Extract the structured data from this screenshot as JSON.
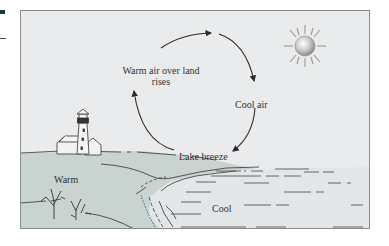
{
  "diagram": {
    "labels": {
      "warm_air_line1": "Warm air over land",
      "warm_air_line2": "rises",
      "cool_air": "Cool air",
      "lake_breeze": "Lake breeze",
      "warm": "Warm",
      "cool": "Cool"
    },
    "icons": [
      "sun-icon",
      "lighthouse-icon",
      "house-icon",
      "shrub-icon"
    ],
    "colors": {
      "sky": "#e9ebec",
      "land": "#c9d3cf",
      "water": "#e3e6e8",
      "line": "#2b2b2b",
      "frame": "#8a8d8f"
    },
    "circulation": {
      "direction": "clockwise",
      "segments": [
        "Warm air over land rises",
        "Cool air",
        "Lake breeze"
      ]
    }
  }
}
